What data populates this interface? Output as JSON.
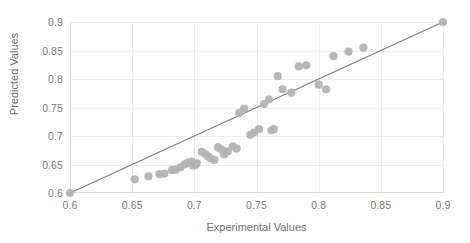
{
  "chart_data": {
    "type": "scatter",
    "title": "",
    "xlabel": "Experimental Values",
    "ylabel": "Predicted Values",
    "xlim": [
      0.6,
      0.9
    ],
    "ylim": [
      0.6,
      0.9
    ],
    "xticks": [
      "0.6",
      "0.65",
      "0.7",
      "0.75",
      "0.8",
      "0.85",
      "0.9"
    ],
    "yticks": [
      "0.9",
      "0.85",
      "0.8",
      "0.75",
      "0.7",
      "0.65",
      "0.6"
    ],
    "xtick_values": [
      0.6,
      0.65,
      0.7,
      0.75,
      0.8,
      0.85,
      0.9
    ],
    "ytick_values": [
      0.9,
      0.85,
      0.8,
      0.75,
      0.7,
      0.65,
      0.6
    ],
    "grid": true,
    "legend": "none",
    "marker_color": "#b3b3b3",
    "line_color": "#7f7f7f",
    "axis_color": "#d9d9d9",
    "grid_color": "#ededed",
    "tick_label_color": "#7a7a7a",
    "axis_title_color": "#6e6e6e",
    "series": [
      {
        "name": "parity-line",
        "type": "line",
        "annotation": "y = x reference line",
        "x": [
          0.6,
          0.9
        ],
        "y": [
          0.6,
          0.9
        ]
      },
      {
        "name": "predictions",
        "type": "scatter",
        "points": [
          [
            0.6,
            0.6
          ],
          [
            0.652,
            0.624
          ],
          [
            0.663,
            0.629
          ],
          [
            0.672,
            0.633
          ],
          [
            0.676,
            0.634
          ],
          [
            0.682,
            0.64
          ],
          [
            0.685,
            0.641
          ],
          [
            0.689,
            0.645
          ],
          [
            0.692,
            0.65
          ],
          [
            0.694,
            0.652
          ],
          [
            0.696,
            0.654
          ],
          [
            0.698,
            0.655
          ],
          [
            0.699,
            0.648
          ],
          [
            0.701,
            0.649
          ],
          [
            0.702,
            0.652
          ],
          [
            0.706,
            0.672
          ],
          [
            0.709,
            0.668
          ],
          [
            0.711,
            0.664
          ],
          [
            0.713,
            0.661
          ],
          [
            0.716,
            0.658
          ],
          [
            0.719,
            0.68
          ],
          [
            0.722,
            0.676
          ],
          [
            0.724,
            0.668
          ],
          [
            0.727,
            0.673
          ],
          [
            0.731,
            0.682
          ],
          [
            0.734,
            0.678
          ],
          [
            0.736,
            0.74
          ],
          [
            0.74,
            0.748
          ],
          [
            0.745,
            0.702
          ],
          [
            0.748,
            0.706
          ],
          [
            0.752,
            0.712
          ],
          [
            0.756,
            0.756
          ],
          [
            0.76,
            0.764
          ],
          [
            0.762,
            0.71
          ],
          [
            0.764,
            0.712
          ],
          [
            0.767,
            0.805
          ],
          [
            0.771,
            0.782
          ],
          [
            0.778,
            0.776
          ],
          [
            0.784,
            0.822
          ],
          [
            0.79,
            0.824
          ],
          [
            0.8,
            0.79
          ],
          [
            0.806,
            0.782
          ],
          [
            0.812,
            0.84
          ],
          [
            0.824,
            0.848
          ],
          [
            0.836,
            0.855
          ],
          [
            0.9,
            0.9
          ]
        ]
      }
    ]
  },
  "axes": {
    "ylabel": "Predicted Values",
    "xlabel": "Experimental Values"
  }
}
